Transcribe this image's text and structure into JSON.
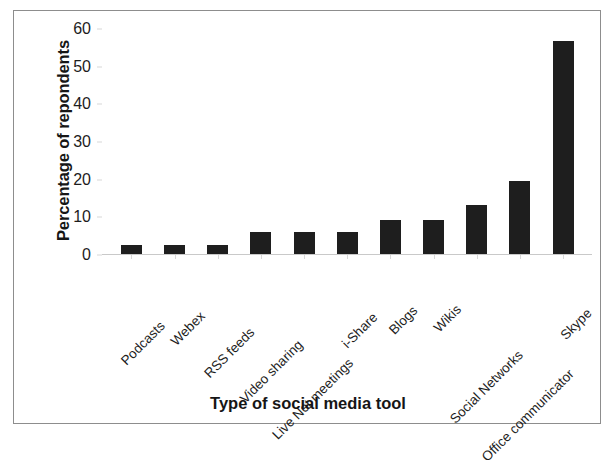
{
  "chart_data": {
    "type": "bar",
    "title": "",
    "xlabel": "Type of social media tool",
    "ylabel": "Percentage of repondents",
    "categories": [
      "Podcasts",
      "Webex",
      "RSS feeds",
      "Video sharing",
      "Live Net meetings",
      "i-Share",
      "Blogs",
      "Wikis",
      "Social Networks",
      "Office communicator",
      "Skype"
    ],
    "values": [
      2.7,
      2.7,
      2.7,
      6.0,
      6.0,
      6.0,
      9.3,
      9.3,
      13.3,
      19.7,
      56.7
    ],
    "ylim": [
      0,
      60
    ],
    "yticks": [
      0,
      10,
      20,
      30,
      40,
      50,
      60
    ],
    "ytick_labels": [
      "0",
      "10",
      "20",
      "30",
      "40",
      "50",
      "60"
    ],
    "grid": false,
    "legend": false,
    "bar_color": "#1e1e1e",
    "axis_color": "#c9c9c9",
    "background": "#ffffff"
  }
}
